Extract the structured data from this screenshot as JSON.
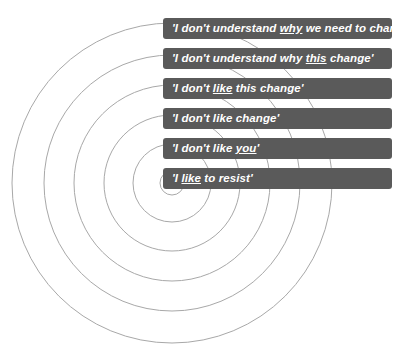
{
  "diagram": {
    "type": "concentric-rings-with-labels",
    "background_color": "#ffffff",
    "ring_color": "#a8a8a8",
    "bar_color": "#5a5a5a",
    "bar_text_color": "#ffffff",
    "center": {
      "x": 172,
      "y": 183
    },
    "rings": [
      {
        "index": 1,
        "radius": 160,
        "label_index": 0
      },
      {
        "index": 2,
        "radius": 128,
        "label_index": 1
      },
      {
        "index": 3,
        "radius": 98,
        "label_index": 2
      },
      {
        "index": 4,
        "radius": 68,
        "label_index": 3
      },
      {
        "index": 5,
        "radius": 39,
        "label_index": 4
      },
      {
        "index": 6,
        "radius": 12,
        "label_index": 5
      }
    ],
    "labels": [
      {
        "id": "label-dont-understand-why-need-to-change",
        "y": 18,
        "parts": [
          {
            "text": "'I don't understand ",
            "underline": false
          },
          {
            "text": "why",
            "underline": true
          },
          {
            "text": " we need to change'",
            "underline": false
          }
        ],
        "plain": "'I don't understand why we need to change'"
      },
      {
        "id": "label-dont-understand-why-this-change",
        "y": 48,
        "parts": [
          {
            "text": "'I don't understand why ",
            "underline": false
          },
          {
            "text": "this",
            "underline": true
          },
          {
            "text": " change'",
            "underline": false
          }
        ],
        "plain": "'I don't understand why this change'"
      },
      {
        "id": "label-dont-like-this-change",
        "y": 78,
        "parts": [
          {
            "text": "'I don't ",
            "underline": false
          },
          {
            "text": "like",
            "underline": true
          },
          {
            "text": " this change'",
            "underline": false
          }
        ],
        "plain": "'I don't like this change'"
      },
      {
        "id": "label-dont-like-change",
        "y": 108,
        "parts": [
          {
            "text": "'I don't like change'",
            "underline": false
          }
        ],
        "plain": "'I don't like change'"
      },
      {
        "id": "label-dont-like-you",
        "y": 138,
        "parts": [
          {
            "text": "'I don't like ",
            "underline": false
          },
          {
            "text": "you",
            "underline": true
          },
          {
            "text": "'",
            "underline": false
          }
        ],
        "plain": "'I don't like you'"
      },
      {
        "id": "label-like-to-resist",
        "y": 168,
        "parts": [
          {
            "text": "'I ",
            "underline": false
          },
          {
            "text": "like",
            "underline": true
          },
          {
            "text": " to resist'",
            "underline": false
          }
        ],
        "plain": "'I like to resist'"
      }
    ]
  }
}
